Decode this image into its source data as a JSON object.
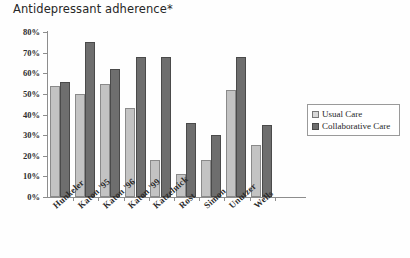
{
  "chart_data": {
    "type": "bar",
    "title": "Antidepressant adherence*",
    "xlabel": "",
    "ylabel": "",
    "ylim": [
      0,
      80
    ],
    "ytick_labels": [
      "80%",
      "70%",
      "60%",
      "50%",
      "40%",
      "30%",
      "20%",
      "10%",
      "0%"
    ],
    "ytick_values": [
      80,
      70,
      60,
      50,
      40,
      30,
      20,
      10,
      0
    ],
    "grid": false,
    "legend_position": "right-middle",
    "categories": [
      "Hunkeler",
      "Katon '95",
      "Katon '96",
      "Katon '99",
      "Katzelnick",
      "Rost",
      "Simon",
      "Unutzer",
      "Wells"
    ],
    "series": [
      {
        "name": "Usual Care",
        "color": "#c3c3c3",
        "values": [
          54,
          50,
          55,
          43,
          18,
          11,
          18,
          52,
          25
        ]
      },
      {
        "name": "Collaborative Care",
        "color": "#6e6e6e",
        "values": [
          56,
          75,
          62,
          68,
          68,
          36,
          30,
          68,
          35
        ]
      }
    ]
  },
  "legend": {
    "items": [
      {
        "label": "Usual Care",
        "swatch": "usual"
      },
      {
        "label": "Collaborative Care",
        "swatch": "collab"
      }
    ]
  }
}
